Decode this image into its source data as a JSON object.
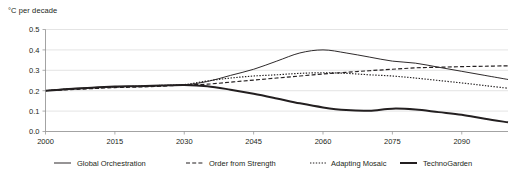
{
  "chart_data": {
    "type": "line",
    "title": "",
    "subtitle": "",
    "ylabel": "°C per decade",
    "xlabel": "",
    "ylim": [
      0.0,
      0.5
    ],
    "xlim": [
      2000,
      2100
    ],
    "grid": true,
    "legend_position": "bottom",
    "ytick_labels": [
      "0.0",
      "0.1",
      "0.2",
      "0.3",
      "0.4",
      "0.5"
    ],
    "ytick_values": [
      0.0,
      0.1,
      0.2,
      0.3,
      0.4,
      0.5
    ],
    "xtick_labels": [
      "2000",
      "2015",
      "2030",
      "2045",
      "2060",
      "2075",
      "2090"
    ],
    "xtick_values": [
      2000,
      2015,
      2030,
      2045,
      2060,
      2075,
      2090
    ],
    "x": [
      2000,
      2005,
      2010,
      2015,
      2020,
      2025,
      2030,
      2035,
      2040,
      2045,
      2050,
      2055,
      2060,
      2065,
      2070,
      2075,
      2080,
      2085,
      2090,
      2095,
      2100
    ],
    "series": [
      {
        "name": "Global Orchestration",
        "style": "solid-thin",
        "color": "#231f20",
        "values": [
          0.2,
          0.21,
          0.215,
          0.22,
          0.222,
          0.225,
          0.228,
          0.245,
          0.275,
          0.305,
          0.345,
          0.385,
          0.4,
          0.385,
          0.365,
          0.345,
          0.335,
          0.315,
          0.295,
          0.275,
          0.255
        ]
      },
      {
        "name": "Order from Strength",
        "style": "dashed",
        "color": "#231f20",
        "values": [
          0.2,
          0.205,
          0.21,
          0.215,
          0.218,
          0.222,
          0.228,
          0.232,
          0.242,
          0.252,
          0.262,
          0.272,
          0.282,
          0.29,
          0.298,
          0.305,
          0.312,
          0.315,
          0.318,
          0.32,
          0.322
        ]
      },
      {
        "name": "Adapting Mosaic",
        "style": "dotted",
        "color": "#231f20",
        "values": [
          0.2,
          0.208,
          0.213,
          0.218,
          0.222,
          0.226,
          0.23,
          0.248,
          0.262,
          0.272,
          0.278,
          0.285,
          0.288,
          0.285,
          0.278,
          0.272,
          0.262,
          0.25,
          0.238,
          0.225,
          0.212
        ]
      },
      {
        "name": "TechnoGarden",
        "style": "solid-thick",
        "color": "#231f20",
        "values": [
          0.2,
          0.208,
          0.215,
          0.22,
          0.222,
          0.225,
          0.228,
          0.222,
          0.205,
          0.185,
          0.162,
          0.138,
          0.118,
          0.105,
          0.102,
          0.112,
          0.108,
          0.095,
          0.082,
          0.062,
          0.045
        ]
      }
    ]
  },
  "legend": {
    "items": [
      {
        "label": "Global Orchestration",
        "style": "solid-thin"
      },
      {
        "label": "Order from Strength",
        "style": "dashed"
      },
      {
        "label": "Adapting Mosaic",
        "style": "dotted"
      },
      {
        "label": "TechnoGarden",
        "style": "solid-thick"
      }
    ]
  }
}
